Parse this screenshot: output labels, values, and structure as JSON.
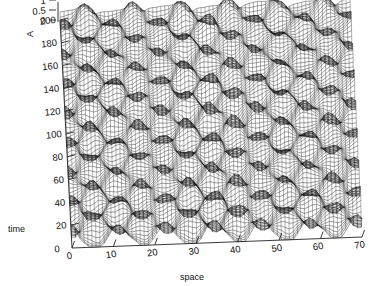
{
  "chart_data": {
    "type": "surface",
    "title": "",
    "subtitle": "",
    "projection": "3d-wireframe-mesh",
    "xlabel": "space",
    "ylabel": "time",
    "zlabel": "A",
    "xlim": [
      0,
      70
    ],
    "ylim": [
      0,
      200
    ],
    "zlim": [
      0,
      1
    ],
    "x_ticks": [
      0,
      10,
      20,
      30,
      40,
      50,
      60,
      70
    ],
    "y_ticks": [
      0,
      20,
      40,
      60,
      80,
      100,
      120,
      140,
      160,
      180,
      200
    ],
    "z_ticks": [
      0,
      0.5,
      1
    ],
    "x_tick_labels": [
      "0",
      "10",
      "20",
      "30",
      "40",
      "50",
      "60",
      "70"
    ],
    "y_tick_labels": [
      "0",
      "20",
      "40",
      "60",
      "80",
      "100",
      "120",
      "140",
      "160",
      "180",
      "200"
    ],
    "z_tick_labels": [
      "0",
      "0.5",
      "1"
    ],
    "grid": false,
    "legend": "none",
    "mesh_nx": 72,
    "mesh_ny": 150,
    "surface_color": "#000000",
    "background": "#ffffff",
    "field": {
      "formula": "A = 0.5*(sin-type localized bumps superposed on two tilted periodic wave trains)",
      "space_period": 11.5,
      "time_period": 26.0,
      "amplitude_peak": 1.0,
      "amplitude_base": 0.0
    }
  },
  "axes": {
    "x_axis_name": "space-axis",
    "y_axis_name": "time-axis",
    "z_axis_name": "amplitude-axis"
  }
}
